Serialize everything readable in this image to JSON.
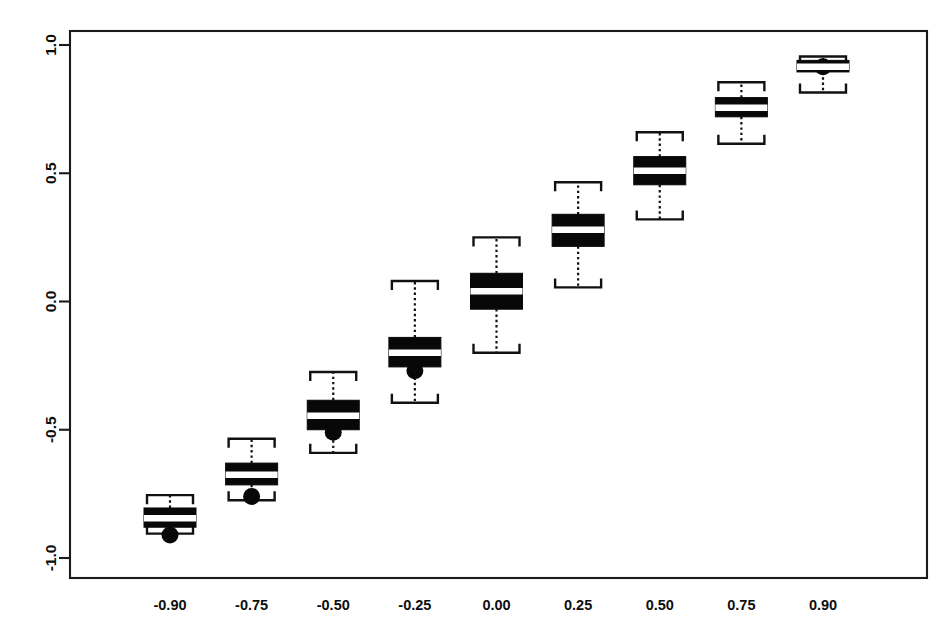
{
  "chart_data": {
    "type": "box",
    "title": "",
    "subtitle": "",
    "xlabel": "",
    "ylabel": "",
    "xlim": [
      -1.125,
      1.125
    ],
    "ylim": [
      -1.15,
      1.12
    ],
    "grid": false,
    "legend": null,
    "y_axis": {
      "ticks": [
        -1.0,
        -0.5,
        0.0,
        0.5,
        1.0
      ],
      "tick_labels": [
        "-1.0",
        "-0.5",
        "0.0",
        "0.5",
        "1.0"
      ],
      "label_rotation": -90
    },
    "x_axis": {
      "ticks": [
        -0.9,
        -0.75,
        -0.5,
        -0.25,
        0.0,
        0.25,
        0.5,
        0.75,
        0.9
      ],
      "tick_labels": [
        "-0.90",
        "-0.75",
        "-0.50",
        "-0.25",
        "0.00",
        "0.25",
        "0.50",
        "0.75",
        "0.90"
      ]
    },
    "categories": [
      "-0.90",
      "-0.75",
      "-0.50",
      "-0.25",
      "0.00",
      "0.25",
      "0.50",
      "0.75",
      "0.90"
    ],
    "boxes": [
      {
        "category": "-0.90",
        "x": -0.9,
        "whisker_low": -0.905,
        "q1": -0.88,
        "median": -0.845,
        "q3": -0.805,
        "whisker_high": -0.755,
        "outliers": [
          -0.91
        ]
      },
      {
        "category": "-0.75",
        "x": -0.75,
        "whisker_low": -0.775,
        "q1": -0.715,
        "median": -0.675,
        "q3": -0.63,
        "whisker_high": -0.535,
        "outliers": [
          -0.76
        ]
      },
      {
        "category": "-0.50",
        "x": -0.5,
        "whisker_low": -0.59,
        "q1": -0.5,
        "median": -0.445,
        "q3": -0.385,
        "whisker_high": -0.275,
        "outliers": [
          -0.51
        ]
      },
      {
        "category": "-0.25",
        "x": -0.25,
        "whisker_low": -0.395,
        "q1": -0.255,
        "median": -0.2,
        "q3": -0.14,
        "whisker_high": 0.08,
        "outliers": [
          -0.27
        ]
      },
      {
        "category": "0.00",
        "x": 0.0,
        "whisker_low": -0.2,
        "q1": -0.03,
        "median": 0.04,
        "q3": 0.11,
        "whisker_high": 0.25,
        "outliers": []
      },
      {
        "category": "0.25",
        "x": 0.25,
        "whisker_low": 0.055,
        "q1": 0.215,
        "median": 0.28,
        "q3": 0.34,
        "whisker_high": 0.465,
        "outliers": []
      },
      {
        "category": "0.50",
        "x": 0.5,
        "whisker_low": 0.32,
        "q1": 0.455,
        "median": 0.51,
        "q3": 0.565,
        "whisker_high": 0.66,
        "outliers": []
      },
      {
        "category": "0.75",
        "x": 0.75,
        "whisker_low": 0.615,
        "q1": 0.72,
        "median": 0.755,
        "q3": 0.795,
        "whisker_high": 0.855,
        "outliers": [
          0.755
        ]
      },
      {
        "category": "0.90",
        "x": 0.9,
        "whisker_low": 0.815,
        "q1": 0.895,
        "median": 0.915,
        "q3": 0.94,
        "whisker_high": 0.955,
        "outliers": [
          0.915
        ]
      }
    ]
  }
}
